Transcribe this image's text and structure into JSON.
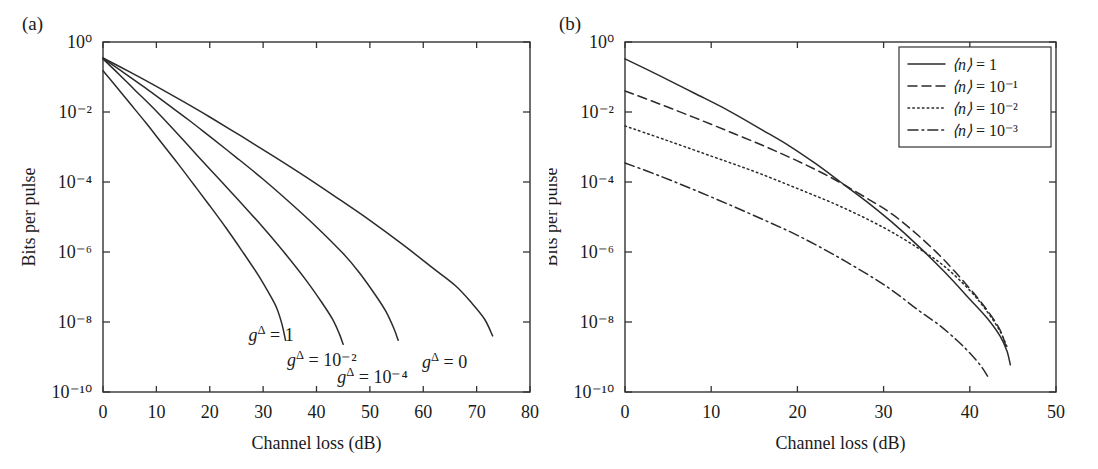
{
  "figure": {
    "panels": [
      {
        "tag": "(a)",
        "xlabel": "Channel loss (dB)",
        "ylabel": "Bits per pulse",
        "xticks": [
          0,
          10,
          20,
          30,
          40,
          50,
          60,
          70,
          80
        ],
        "xticklabels": [
          "0",
          "10",
          "20",
          "30",
          "40",
          "50",
          "60",
          "70",
          "80"
        ],
        "yticklabels": [
          "10⁰",
          "10⁻²",
          "10⁻⁴",
          "10⁻⁶",
          "10⁻⁸",
          "10⁻¹⁰"
        ],
        "annotations": [
          {
            "name": "g-delta-1",
            "base": "g",
            "sup": "Δ",
            "rest": " = 1",
            "x": 31.5,
            "y_exp": -8.55
          },
          {
            "name": "g-delta-1e-2",
            "base": "g",
            "sup": "Δ",
            "rest": " = 10⁻²",
            "x": 41.0,
            "y_exp": -9.25
          },
          {
            "name": "g-delta-1e-4",
            "base": "g",
            "sup": "Δ",
            "rest": " = 10⁻⁴",
            "x": 50.5,
            "y_exp": -9.75
          },
          {
            "name": "g-delta-0",
            "base": "g",
            "sup": "Δ",
            "rest": " = 0",
            "x": 64.0,
            "y_exp": -9.3
          }
        ]
      },
      {
        "tag": "(b)",
        "xlabel": "Channel loss (dB)",
        "ylabel": "Bits per pulse",
        "xticks": [
          0,
          10,
          20,
          30,
          40,
          50
        ],
        "xticklabels": [
          "0",
          "10",
          "20",
          "30",
          "40",
          "50"
        ],
        "yticklabels": [
          "10⁰",
          "10⁻²",
          "10⁻⁴",
          "10⁻⁶",
          "10⁻⁸",
          "10⁻¹⁰"
        ],
        "annotations": [],
        "legend": {
          "entries": [
            {
              "name": "legend-n-1",
              "base": "⟨n⟩",
              "rest": " = 1",
              "style": "solid"
            },
            {
              "name": "legend-n-1e-1",
              "base": "⟨n⟩",
              "rest": " = 10⁻¹",
              "style": "dashed"
            },
            {
              "name": "legend-n-1e-2",
              "base": "⟨n⟩",
              "rest": " = 10⁻²",
              "style": "dotted"
            },
            {
              "name": "legend-n-1e-3",
              "base": "⟨n⟩",
              "rest": " = 10⁻³",
              "style": "dashdot"
            }
          ]
        }
      }
    ]
  },
  "chart_data": [
    {
      "type": "line",
      "panel": "(a)",
      "title": "",
      "xlabel": "Channel loss (dB)",
      "ylabel": "Bits per pulse",
      "xlim": [
        0,
        80
      ],
      "ylim": [
        1e-10,
        1
      ],
      "yscale": "log",
      "grid": false,
      "legend": "none",
      "series": [
        {
          "name": "g^Δ = 1",
          "style": "solid",
          "x": [
            0,
            2,
            5,
            8,
            11,
            14,
            17,
            20,
            23,
            26,
            29,
            31,
            32.5,
            33.5,
            34.2
          ],
          "y": [
            0.15,
            0.065,
            0.018,
            0.005,
            0.0013,
            0.00034,
            8.5e-05,
            2.1e-05,
            5e-06,
            1.1e-06,
            2.3e-07,
            7e-08,
            2.6e-08,
            9e-09,
            3e-09
          ]
        },
        {
          "name": "g^Δ = 10⁻²",
          "style": "solid",
          "x": [
            0,
            3,
            6,
            9,
            12,
            15,
            18,
            22,
            26,
            30,
            34,
            38,
            41,
            43,
            44.3,
            45.0
          ],
          "y": [
            0.33,
            0.12,
            0.042,
            0.015,
            0.005,
            0.0016,
            0.0005,
            0.00011,
            2.4e-05,
            5e-06,
            9.5e-07,
            1.6e-07,
            3.6e-08,
            1.2e-08,
            4.5e-09,
            2.3e-09
          ]
        },
        {
          "name": "g^Δ = 10⁻⁴",
          "style": "solid",
          "x": [
            0,
            4,
            8,
            12,
            16,
            20,
            25,
            30,
            35,
            40,
            45,
            48,
            51,
            53,
            54.5,
            55.3
          ],
          "y": [
            0.34,
            0.13,
            0.048,
            0.017,
            0.006,
            0.002,
            0.0005,
            0.00012,
            2.6e-05,
            5.2e-06,
            9e-07,
            2.6e-07,
            6e-08,
            2e-08,
            6.5e-09,
            3e-09
          ]
        },
        {
          "name": "g^Δ = 0",
          "style": "solid",
          "x": [
            0,
            5,
            10,
            15,
            20,
            26,
            32,
            38,
            44,
            50,
            56,
            62,
            66,
            69,
            71.5,
            73.0
          ],
          "y": [
            0.35,
            0.14,
            0.054,
            0.02,
            0.0072,
            0.002,
            0.00054,
            0.00014,
            3.4e-05,
            8e-06,
            1.7e-06,
            3.3e-07,
            1.1e-07,
            3.6e-08,
            1.2e-08,
            4e-09
          ]
        }
      ]
    },
    {
      "type": "line",
      "panel": "(b)",
      "title": "",
      "xlabel": "Channel loss (dB)",
      "ylabel": "Bits per pulse",
      "xlim": [
        0,
        50
      ],
      "ylim": [
        1e-10,
        1
      ],
      "yscale": "log",
      "grid": false,
      "legend": "upper right",
      "series": [
        {
          "name": "⟨n⟩ = 1",
          "style": "solid",
          "x": [
            0,
            4,
            8,
            12,
            16,
            19,
            22,
            25,
            28,
            31,
            34,
            37,
            40,
            42,
            43.5,
            44.3,
            44.7
          ],
          "y": [
            0.33,
            0.11,
            0.035,
            0.011,
            0.003,
            0.0011,
            0.00035,
            0.0001,
            2.8e-05,
            7e-06,
            1.5e-06,
            2.8e-07,
            4.5e-08,
            1.3e-08,
            4e-09,
            1.5e-09,
            6e-10
          ]
        },
        {
          "name": "⟨n⟩ = 10⁻¹",
          "style": "dashed",
          "x": [
            0,
            4,
            8,
            12,
            16,
            20,
            24,
            28,
            31,
            34,
            37,
            40,
            42,
            43.5,
            44.2
          ],
          "y": [
            0.04,
            0.017,
            0.007,
            0.0028,
            0.0011,
            0.0004,
            0.00013,
            3.5e-05,
            1.2e-05,
            3e-06,
            6e-07,
            9e-08,
            2.2e-08,
            6e-09,
            2e-09
          ]
        },
        {
          "name": "⟨n⟩ = 10⁻²",
          "style": "dotted",
          "x": [
            0,
            5,
            10,
            15,
            20,
            25,
            30,
            34,
            37,
            40,
            42,
            43.5,
            44.3
          ],
          "y": [
            0.004,
            0.0015,
            0.00055,
            0.0002,
            6.5e-05,
            2e-05,
            5e-06,
            1.3e-06,
            4e-07,
            8e-08,
            2e-08,
            5.5e-09,
            2e-09
          ]
        },
        {
          "name": "⟨n⟩ = 10⁻³",
          "style": "dashdot",
          "x": [
            0,
            4,
            8,
            12,
            16,
            20,
            24,
            28,
            31,
            34,
            36.5,
            38.5,
            40,
            41.3,
            42.2
          ],
          "y": [
            0.00035,
            0.00015,
            6e-05,
            2.3e-05,
            8.5e-06,
            3e-06,
            9e-07,
            2.4e-07,
            8e-08,
            2.2e-08,
            8e-09,
            3e-09,
            1.3e-09,
            5.5e-10,
            2.5e-10
          ]
        }
      ]
    }
  ]
}
